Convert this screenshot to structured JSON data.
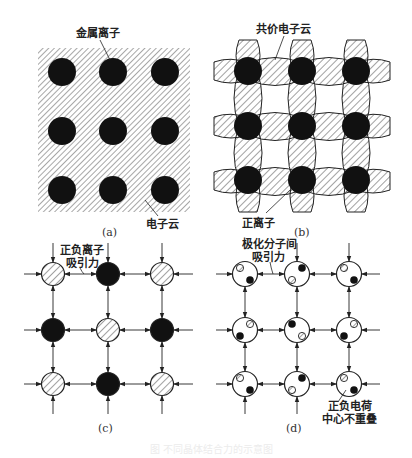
{
  "figure": {
    "panels": {
      "a": {
        "caption": "(a)",
        "label_ion": "金属离子",
        "label_cloud": "电子云"
      },
      "b": {
        "caption": "(b)",
        "label_cloud": "共价电子云",
        "label_ion": "正离子"
      },
      "c": {
        "caption": "(c)",
        "label_line1": "正负离子",
        "label_line2": "吸引力",
        "pattern": [
          [
            "hatched",
            "solid",
            "hatched"
          ],
          [
            "solid",
            "hatched",
            "solid"
          ],
          [
            "hatched",
            "solid",
            "hatched"
          ]
        ]
      },
      "d": {
        "caption": "(d)",
        "label_top_line1": "极化分子间",
        "label_top_line2": "吸引力",
        "label_bottom_line1": "正负电荷",
        "label_bottom_line2": "中心不重叠"
      }
    },
    "faint_caption": "图  不同晶体结合力的示意图",
    "colors": {
      "ink": "#111111",
      "hatch": "#555555",
      "background": "#ffffff"
    }
  }
}
